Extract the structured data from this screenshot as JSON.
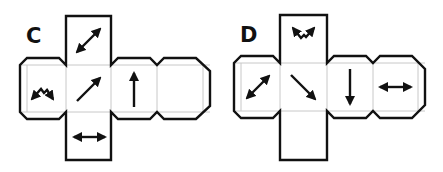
{
  "figure": {
    "type": "cube-net-puzzle",
    "nets": [
      {
        "label": "C",
        "faces": {
          "top": "diagonal double-headed arrow (bottom-left to top-right)",
          "left": "zigzag / caret with two outward arrowheads (down-left and down-right)",
          "center": "single arrow pointing up-right",
          "third": "single arrow pointing up",
          "fourth": "blank",
          "bottom": "horizontal double-headed arrow"
        }
      },
      {
        "label": "D",
        "faces": {
          "top": "inverted caret with two outward arrowheads (up-left and up-right)",
          "left": "diagonal double-headed arrow (bottom-left to top-right)",
          "center": "single arrow pointing down-right",
          "third": "single arrow pointing down",
          "fourth": "horizontal double-headed arrow",
          "bottom": "blank"
        }
      }
    ],
    "colors": {
      "outline": "#111111",
      "fold_line": "#c8c8c8",
      "background": "#ffffff"
    }
  }
}
